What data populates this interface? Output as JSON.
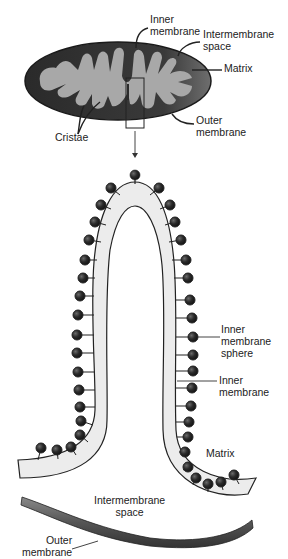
{
  "figure": {
    "colors": {
      "outer_membrane": "#2b2b2b",
      "intermembrane": "#5a5a5a",
      "matrix": "#a8a8a8",
      "crista_fill": "#ececec",
      "sphere": "#2a2a2a",
      "line": "#222222"
    }
  },
  "top_labels": {
    "inner_membrane": [
      "Inner",
      "membrane"
    ],
    "intermembrane_space": [
      "Intermembrane",
      "space"
    ],
    "matrix": [
      "Matrix"
    ],
    "outer_membrane": [
      "Outer",
      "membrane"
    ],
    "cristae": [
      "Cristae"
    ]
  },
  "bottom_labels": {
    "inner_membrane_sphere": [
      "Inner",
      "membrane",
      "sphere"
    ],
    "inner_membrane": [
      "Inner",
      "membrane"
    ],
    "matrix": [
      "Matrix"
    ],
    "intermembrane_space": [
      "Intermembrane",
      "space"
    ],
    "outer_membrane": [
      "Outer",
      "membrane"
    ]
  }
}
